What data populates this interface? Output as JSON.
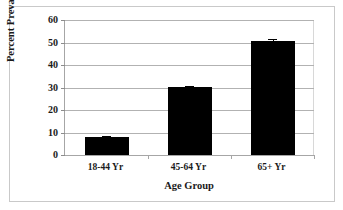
{
  "chart_data": {
    "type": "bar",
    "title": "",
    "xlabel": "Age Group",
    "ylabel": "Percent Prevalence",
    "categories": [
      "18-44 Yr",
      "45-64 Yr",
      "65+ Yr"
    ],
    "values": [
      7.8,
      30.1,
      50.8
    ],
    "errors": [
      0.5,
      0.5,
      0.7
    ],
    "ylim": [
      0,
      60
    ],
    "yticks": [
      0,
      10,
      20,
      30,
      40,
      50,
      60
    ],
    "ytick_labels": [
      "0",
      "10",
      "20",
      "30",
      "40",
      "50",
      "60"
    ],
    "grid": "horizontal",
    "legend": "none",
    "bar_color": "#000000",
    "gridline_color": "#b2b2b2",
    "axis_color": "#a6a6a6",
    "frame_color": "#c9c9c9"
  }
}
